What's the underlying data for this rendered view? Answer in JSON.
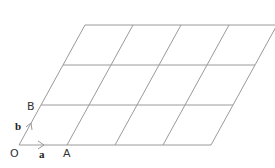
{
  "diagram": {
    "type": "parallelogram-grid",
    "columns": 4,
    "rows": 3,
    "stroke_color": "#9a9a9a",
    "origin": [
      19,
      145
    ],
    "vector_a": [
      48,
      0
    ],
    "vector_b": [
      22,
      -40
    ],
    "points": {
      "O": "O",
      "A": "A",
      "B": "B"
    },
    "vectors": {
      "a": "a",
      "b": "b"
    }
  }
}
